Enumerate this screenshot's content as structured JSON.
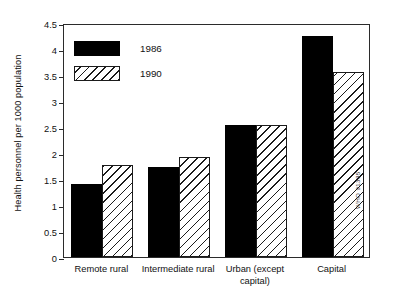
{
  "chart_data": {
    "type": "bar",
    "title": "",
    "xlabel": "",
    "ylabel": "Health personnel per 1000 population",
    "ylim": [
      0,
      4.5
    ],
    "ytick_step": 0.5,
    "yticks": [
      "0",
      "0.5",
      "1",
      "1.5",
      "2",
      "2.5",
      "3",
      "3.5",
      "4",
      "4.5"
    ],
    "grid": false,
    "legend_position": "upper left",
    "categories": [
      "Remote rural",
      "Intermediate rural",
      "Urban (except capital)",
      "Capital"
    ],
    "series": [
      {
        "name": "1986",
        "fill": "solid",
        "color": "#000000",
        "values": [
          1.4,
          1.73,
          2.53,
          4.25
        ]
      },
      {
        "name": "1990",
        "fill": "hatch",
        "color": "#ffffff",
        "values": [
          1.77,
          1.92,
          2.53,
          3.55
        ]
      }
    ]
  },
  "legend": {
    "entries": [
      {
        "label": "1986",
        "fill": "solid"
      },
      {
        "label": "1990",
        "fill": "hatch"
      }
    ]
  },
  "xlabels": [
    {
      "line1": "Remote rural",
      "line2": ""
    },
    {
      "line1": "Intermediate rural",
      "line2": ""
    },
    {
      "line1": "Urban (except",
      "line2": "capital)"
    },
    {
      "line1": "Capital",
      "line2": ""
    }
  ],
  "watermark": "WHO 91335"
}
